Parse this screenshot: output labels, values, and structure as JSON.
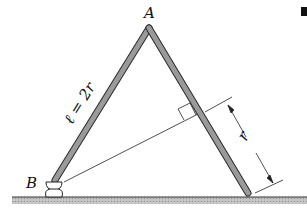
{
  "diagram": {
    "labels": {
      "apex": "A",
      "base": "B",
      "length": "ℓ = 2r",
      "distance": "r"
    },
    "colors": {
      "rod_fill": "#9a9a9a",
      "rod_stroke": "#2a2a2a",
      "ground": "#b8b8b8",
      "line": "#222222"
    },
    "elements": [
      "rod-AB",
      "rod-A-right",
      "hinge-B",
      "ground",
      "perpendicular-from-B",
      "right-angle-marker",
      "dimension-r"
    ]
  }
}
